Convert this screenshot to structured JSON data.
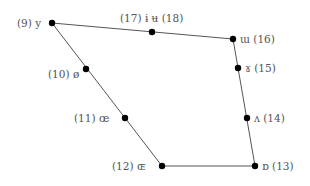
{
  "diagram": {
    "type": "vowel-quadrilateral",
    "line_color": "#555555",
    "point_color": "#000000",
    "points": [
      {
        "id": "9",
        "label": "(9) y",
        "x": 52,
        "y": 23
      },
      {
        "id": "17_18",
        "label": "(17) ɨ ʉ (18)",
        "x": 152,
        "y": 32
      },
      {
        "id": "16",
        "label": "ɯ (16)",
        "x": 233,
        "y": 39
      },
      {
        "id": "15",
        "label": "ɤ (15)",
        "x": 238,
        "y": 68
      },
      {
        "id": "14",
        "label": "ʌ (14)",
        "x": 247,
        "y": 118
      },
      {
        "id": "13",
        "label": "ɒ (13)",
        "x": 255,
        "y": 166
      },
      {
        "id": "12",
        "label": "(12) ɶ",
        "x": 162,
        "y": 166
      },
      {
        "id": "11",
        "label": "(11) œ",
        "x": 125,
        "y": 118
      },
      {
        "id": "10",
        "label": "(10) ø",
        "x": 86,
        "y": 69
      }
    ]
  }
}
